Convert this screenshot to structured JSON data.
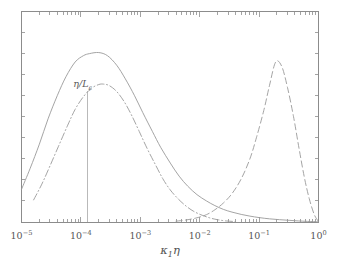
{
  "figure": {
    "background_color": "#ffffff",
    "frame_color": "#8c8c8c",
    "curve_color": "#9a9a9a"
  },
  "annotations": [
    {
      "name": "eta-over-L-epsilon",
      "text_main": "η/L",
      "text_sub": "ε",
      "x_value": 0.00013,
      "leader_top_value": 0.62,
      "leader_bottom_value": 0.0
    }
  ],
  "axes": {
    "x": {
      "label_main_1": "κ",
      "label_sub": "1",
      "label_main_2": "η",
      "scale": "log",
      "min": 1e-05,
      "max": 1.0,
      "tick_values": [
        1e-05,
        0.0001,
        0.001,
        0.01,
        0.1,
        1.0
      ],
      "tick_labels": [
        {
          "mantissa": "10",
          "exponent": "−5"
        },
        {
          "mantissa": "10",
          "exponent": "−4"
        },
        {
          "mantissa": "10",
          "exponent": "−3"
        },
        {
          "mantissa": "10",
          "exponent": "−2"
        },
        {
          "mantissa": "10",
          "exponent": "−1"
        },
        {
          "mantissa": "10",
          "exponent": "0"
        }
      ],
      "minor_ticks": true
    },
    "y": {
      "label": "",
      "scale": "linear",
      "min": 0,
      "max": 1.0,
      "tick_labels": [],
      "minor_ticks": true,
      "n_ticks": 9
    }
  },
  "chart_data": {
    "type": "line",
    "title": "",
    "xlabel": "κ₁η",
    "ylabel": "",
    "xscale": "log",
    "yscale": "linear",
    "xlim": [
      1e-05,
      1.0
    ],
    "ylim": [
      0,
      1.0
    ],
    "grid": false,
    "legend": "none",
    "series": [
      {
        "name": "solid-curve",
        "style": "solid",
        "peak_x": 0.0002,
        "peak_y": 0.805,
        "x": [
          1e-05,
          1.4e-05,
          2e-05,
          2.8e-05,
          4e-05,
          5.6e-05,
          8e-05,
          0.00011,
          0.00014,
          0.0002,
          0.00028,
          0.0004,
          0.00056,
          0.0008,
          0.0011,
          0.0016,
          0.0022,
          0.0032,
          0.0045,
          0.0063,
          0.009,
          0.013,
          0.018,
          0.025,
          0.035,
          0.05,
          0.07,
          0.1,
          0.15,
          0.22,
          0.32,
          0.46,
          0.65,
          1.0
        ],
        "y": [
          0.155,
          0.255,
          0.37,
          0.49,
          0.6,
          0.69,
          0.76,
          0.79,
          0.8,
          0.805,
          0.79,
          0.745,
          0.68,
          0.6,
          0.52,
          0.43,
          0.355,
          0.28,
          0.218,
          0.17,
          0.13,
          0.1,
          0.078,
          0.06,
          0.047,
          0.036,
          0.028,
          0.021,
          0.015,
          0.011,
          0.008,
          0.005,
          0.003,
          0.001
        ]
      },
      {
        "name": "dash-dot-curve",
        "style": "dashdot",
        "peak_x": 0.00024,
        "peak_y": 0.655,
        "x": [
          1.6e-05,
          2.2e-05,
          3e-05,
          4.2e-05,
          6e-05,
          8e-05,
          0.00011,
          0.00015,
          0.0002,
          0.00024,
          0.0003,
          0.0004,
          0.00054,
          0.00072,
          0.00096,
          0.0013,
          0.0018,
          0.0024,
          0.0032,
          0.0044,
          0.006,
          0.008,
          0.011,
          0.015,
          0.02,
          0.028,
          0.04
        ],
        "y": [
          0.105,
          0.18,
          0.265,
          0.36,
          0.46,
          0.535,
          0.595,
          0.635,
          0.653,
          0.655,
          0.648,
          0.62,
          0.57,
          0.505,
          0.43,
          0.35,
          0.272,
          0.205,
          0.152,
          0.108,
          0.074,
          0.05,
          0.032,
          0.019,
          0.011,
          0.005,
          0.002
        ]
      },
      {
        "name": "dashed-curve",
        "style": "dashed",
        "peak_x": 0.19,
        "peak_y": 0.76,
        "x": [
          0.004,
          0.006,
          0.009,
          0.013,
          0.018,
          0.025,
          0.035,
          0.05,
          0.07,
          0.09,
          0.12,
          0.15,
          0.19,
          0.24,
          0.3,
          0.38,
          0.47,
          0.58,
          0.7,
          0.85,
          1.0
        ],
        "y": [
          0.004,
          0.01,
          0.02,
          0.035,
          0.058,
          0.09,
          0.135,
          0.205,
          0.3,
          0.4,
          0.53,
          0.65,
          0.76,
          0.74,
          0.64,
          0.5,
          0.35,
          0.21,
          0.11,
          0.035,
          0.002
        ]
      }
    ]
  }
}
